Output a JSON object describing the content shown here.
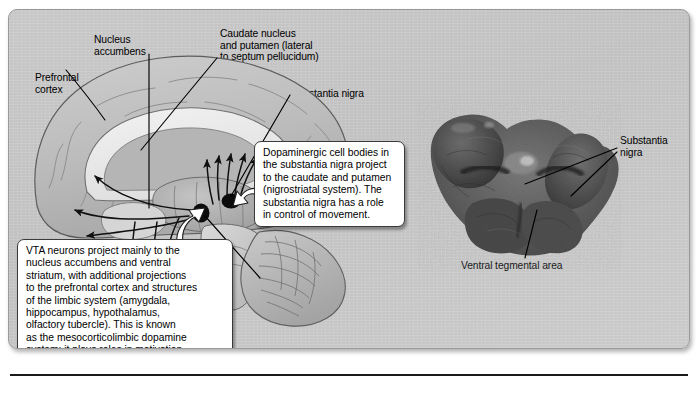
{
  "figure": {
    "panel_bg": "#c8c8c8",
    "callout_bg": "#ffffff",
    "ink": "#000000"
  },
  "diagram_labels": {
    "prefrontal_cortex": "Prefrontal\ncortex",
    "nucleus_accumbens": "Nucleus\naccumbens",
    "caudate_putamen": "Caudate nucleus\nand putamen (lateral\nto septum pellucidum)",
    "substantia_nigra": "Substantia nigra",
    "ventral_tegmental_area": "Ventral\ntegmental\narea (VTA)"
  },
  "photo_labels": {
    "substantia_nigra": "Substantia\nnigra",
    "ventral_tegmental_area": "Ventral tegmental area"
  },
  "callouts": {
    "nigrostriatal": "Dopaminergic cell bodies in\nthe substantia nigra project\nto the caudate  and putamen\n(nigrostriatal system). The\nsubstantia nigra has a role\nin control of movement.",
    "mesocorticolimbic": "VTA neurons project mainly to the\nnucleus accumbens and ventral\nstriatum, with additional projections\nto the prefrontal cortex and structures\nof the limbic system (amygdala,\nhippocampus, hypothalamus,\nolfactory tubercle). This is known\nas the mesocorticolimbic dopamine\nsystem; it plays roles in motivation,\nemotion, reward, addiction, depression."
  }
}
